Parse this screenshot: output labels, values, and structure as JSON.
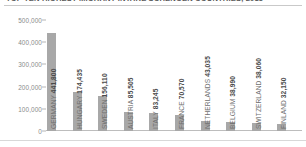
{
  "chart_data": {
    "type": "bar",
    "title": "TOP TEN HIGHEST MIGRANT INTAKE SCHENGEN COUNTRIES, 2015",
    "xlabel": "",
    "ylabel": "",
    "ylim": [
      0,
      500000
    ],
    "grid": false,
    "legend": null,
    "ytick_labels": [
      "500,000",
      "400,000",
      "300,000",
      "200,000",
      "100,000",
      "0"
    ],
    "ytick_values": [
      500000,
      400000,
      300000,
      200000,
      100000,
      0
    ],
    "categories": [
      "GERMANY",
      "HUNGARY",
      "SWEDEN",
      "AUSTRIA",
      "ITALY",
      "FRANCE",
      "NETHERLANDS",
      "BELGIUM",
      "SWITZERLAND",
      "FINLAND"
    ],
    "values": [
      441800,
      174435,
      156110,
      85505,
      83245,
      70570,
      43035,
      38990,
      38060,
      32150
    ],
    "value_labels": [
      "441,800",
      "174,435",
      "156,110",
      "85,505",
      "83,245",
      "70,570",
      "43,035",
      "38,990",
      "38,060",
      "32,150"
    ],
    "bar_color": "#a8a8a8",
    "background_color": "#ffffff"
  }
}
